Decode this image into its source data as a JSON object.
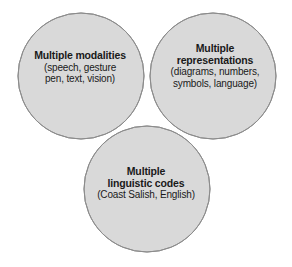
{
  "figure": {
    "name": "venn-diagram",
    "type": "three-set-venn",
    "background_color": "#ffffff"
  },
  "colors": {
    "circle_fill": "#d9d9d9",
    "circle_stroke": "#8c8c8c",
    "pair_overlap_fill": "#b6b6b6",
    "triple_overlap_fill": "#9b9b9b",
    "text_color": "#1a1a1a"
  },
  "sets": [
    {
      "id": "modalities",
      "position": "top-left",
      "center": {
        "cx": 81,
        "cy": 76
      },
      "radius": 63,
      "title_lines": [
        "Multiple modalities"
      ],
      "detail_lines": [
        "(speech, gesture",
        "pen, text, vision)"
      ]
    },
    {
      "id": "representations",
      "position": "top-right",
      "center": {
        "cx": 213,
        "cy": 76
      },
      "radius": 63,
      "title_lines": [
        "Multiple",
        "representations"
      ],
      "detail_lines": [
        "(diagrams, numbers,",
        "symbols, language)"
      ]
    },
    {
      "id": "linguistic-codes",
      "position": "bottom-center",
      "center": {
        "cx": 147,
        "cy": 189
      },
      "radius": 63,
      "title_lines": [
        "Multiple",
        "linguistic codes"
      ],
      "detail_lines": [
        "(Coast Salish, English)"
      ]
    }
  ],
  "labels": {
    "modalities": {
      "line1": "Multiple modalities",
      "line2": "(speech, gesture",
      "line3": "pen, text, vision)"
    },
    "representations": {
      "line1": "Multiple",
      "line2": "representations",
      "line3": "(diagrams, numbers,",
      "line4": "symbols, language)"
    },
    "linguistic": {
      "line1": "Multiple",
      "line2": "linguistic codes",
      "line3": "(Coast Salish, English)"
    }
  }
}
